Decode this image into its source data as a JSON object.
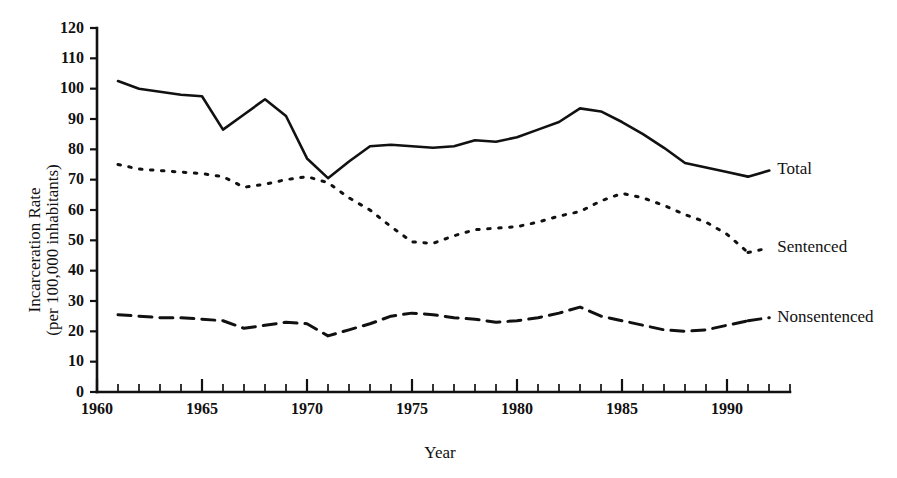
{
  "figure": {
    "axis_titles": {
      "y_line1": "Incarceration Rate",
      "y_line2": "(per 100,000 inhabitants)",
      "x": "Year"
    }
  },
  "chart_data": {
    "type": "line",
    "title": "",
    "xlabel": "Year",
    "ylabel": "Incarceration Rate (per 100,000 inhabitants)",
    "xlim": [
      1960,
      1993
    ],
    "ylim": [
      0,
      120
    ],
    "grid": false,
    "legend_position": "right-inline-labels",
    "y_ticks": [
      0,
      10,
      20,
      30,
      40,
      50,
      60,
      70,
      80,
      90,
      100,
      110,
      120
    ],
    "x_ticks_major": [
      1960,
      1965,
      1970,
      1975,
      1980,
      1985,
      1990
    ],
    "x_ticks_minor_step": 1,
    "x": [
      1961,
      1962,
      1963,
      1964,
      1965,
      1966,
      1967,
      1968,
      1969,
      1970,
      1971,
      1972,
      1973,
      1974,
      1975,
      1976,
      1977,
      1978,
      1979,
      1980,
      1981,
      1982,
      1983,
      1984,
      1985,
      1986,
      1987,
      1988,
      1989,
      1990,
      1991
    ],
    "series": [
      {
        "name": "Total",
        "style": "solid",
        "values": [
          102.5,
          100.0,
          99.0,
          98.0,
          97.5,
          86.5,
          91.5,
          96.5,
          91.0,
          77.0,
          70.5,
          76.0,
          81.0,
          81.5,
          81.0,
          80.5,
          81.0,
          83.0,
          82.5,
          84.0,
          86.5,
          89.0,
          93.5,
          92.5,
          89.0,
          85.0,
          80.5,
          75.5,
          74.0,
          72.5,
          71.0
        ]
      },
      {
        "name": "Sentenced",
        "style": "dotted",
        "values": [
          75.0,
          73.5,
          73.0,
          72.5,
          72.0,
          71.0,
          67.5,
          68.5,
          70.0,
          71.0,
          69.0,
          64.0,
          60.0,
          54.5,
          49.5,
          49.0,
          51.5,
          53.5,
          54.0,
          54.5,
          56.0,
          58.0,
          59.5,
          63.0,
          65.5,
          64.0,
          61.5,
          58.5,
          56.0,
          52.0,
          46.0
        ]
      },
      {
        "name": "Nonsentenced",
        "style": "dashed",
        "values": [
          25.5,
          25.0,
          24.5,
          24.5,
          24.0,
          23.5,
          21.0,
          22.0,
          23.0,
          22.5,
          18.5,
          20.5,
          22.5,
          25.0,
          26.0,
          25.5,
          24.5,
          24.0,
          23.0,
          23.5,
          24.5,
          26.0,
          28.0,
          25.0,
          23.5,
          22.0,
          20.5,
          20.0,
          20.5,
          22.0,
          23.5
        ]
      }
    ],
    "series_labels": [
      {
        "text": "Total",
        "x": 1992.3,
        "y": 73.0
      },
      {
        "text": "Sentenced",
        "x": 1992.3,
        "y": 47.5
      },
      {
        "text": "Nonsentenced",
        "x": 1992.3,
        "y": 24.5
      }
    ]
  }
}
